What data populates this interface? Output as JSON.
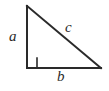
{
  "figure": {
    "name": "right-triangle",
    "background_color": "#ffffff",
    "stroke_color": "#2a2a2a",
    "stroke_width": 2,
    "width": 109,
    "height": 91
  },
  "geometry": {
    "apex": {
      "x": 27,
      "y": 6
    },
    "right_angle_vertex": {
      "x": 27,
      "y": 68
    },
    "base_right_vertex": {
      "x": 101,
      "y": 68
    },
    "right_angle_marker": {
      "size": 10,
      "x": 27,
      "y": 58
    }
  },
  "labels": {
    "leg_vertical": "a",
    "hypotenuse": "c",
    "leg_horizontal": "b"
  }
}
